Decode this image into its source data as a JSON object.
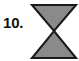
{
  "figure": {
    "item_number": "10.",
    "background_color": "#ffffff",
    "shape": {
      "name": "hourglass-bowtie",
      "description": "Two triangles joined apex to apex forming an hourglass / bowtie outline",
      "fill_color": "#8a8a8a",
      "stroke_color": "#1a1a1a",
      "stroke_width": 2,
      "points_top_triangle": "2,2 46,2 24,28",
      "points_bottom_triangle": "24,28 46,55 2,55",
      "bounds": {
        "x": 30,
        "y": 3,
        "width": 48,
        "height": 57
      }
    }
  }
}
